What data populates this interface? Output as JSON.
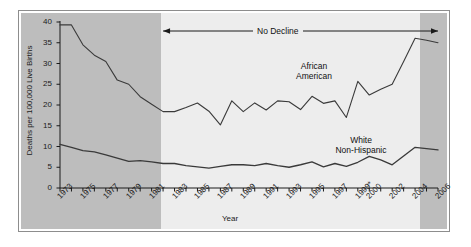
{
  "figure": {
    "background_color": "#ffffff",
    "panel_color": "#bdbdbd",
    "highlight_band_color": "#ededed",
    "line_color": "#3a3a3a"
  },
  "annotations": {
    "no_decline": {
      "text": "No Decline",
      "start_year": 1982,
      "end_year": 2006,
      "arrow": "double-headed"
    }
  },
  "series_labels": {
    "african_american": "African\nAmerican",
    "african_american_line1": "African",
    "african_american_line2": "American",
    "white_non_hispanic_line1": "White",
    "white_non_hispanic_line2": "Non-Hispanic"
  },
  "chart_data": {
    "type": "line",
    "title": "",
    "xlabel": "Year",
    "ylabel": "Deaths per 100,000 Live Births",
    "xlim": [
      1973,
      2006
    ],
    "ylim": [
      0,
      40
    ],
    "yticks": [
      0,
      5,
      10,
      15,
      20,
      25,
      30,
      35,
      40
    ],
    "ytick_labels": [
      "0",
      "5",
      "10",
      "15",
      "20",
      "25",
      "30",
      "35",
      "40"
    ],
    "xticks": [
      1973,
      1974,
      1975,
      1976,
      1977,
      1978,
      1979,
      1980,
      1981,
      1982,
      1983,
      1984,
      1985,
      1986,
      1987,
      1988,
      1989,
      1990,
      1991,
      1992,
      1993,
      1994,
      1995,
      1996,
      1997,
      1998,
      1999,
      2000,
      2001,
      2002,
      2003,
      2004,
      2005,
      2006
    ],
    "xtick_labels": [
      "1973",
      "1975",
      "1977",
      "1979",
      "1981",
      "1983",
      "1985",
      "1987",
      "1989",
      "1991",
      "1993",
      "1995",
      "1997",
      "1999*",
      "2000",
      "2002",
      "2004",
      "2006"
    ],
    "xtick_label_years": [
      1973,
      1975,
      1977,
      1979,
      1981,
      1983,
      1985,
      1987,
      1989,
      1991,
      1993,
      1995,
      1997,
      1999,
      2000,
      2002,
      2004,
      2006
    ],
    "grid": false,
    "legend_position": "inline-labels",
    "x": [
      1973,
      1974,
      1975,
      1976,
      1977,
      1978,
      1979,
      1980,
      1981,
      1982,
      1983,
      1984,
      1985,
      1986,
      1987,
      1988,
      1989,
      1990,
      1991,
      1992,
      1993,
      1994,
      1995,
      1996,
      1997,
      1998,
      1999,
      2000,
      2001,
      2002,
      2003,
      2004,
      2005,
      2006
    ],
    "series": [
      {
        "name": "African American",
        "values": [
          39.3,
          39.3,
          34.5,
          32.0,
          30.5,
          26.0,
          25.0,
          22.0,
          20.2,
          18.4,
          18.4,
          19.4,
          20.5,
          18.5,
          15.2,
          21.0,
          18.4,
          20.5,
          18.8,
          21.0,
          20.8,
          18.9,
          22.1,
          20.4,
          21.0,
          17.0,
          25.7,
          22.4,
          23.8,
          25.0,
          30.5,
          36.1,
          35.6,
          35.0
        ]
      },
      {
        "name": "White Non-Hispanic",
        "values": [
          10.5,
          9.8,
          9.0,
          8.7,
          8.0,
          7.2,
          6.4,
          6.6,
          6.3,
          5.9,
          5.9,
          5.4,
          5.1,
          4.8,
          5.2,
          5.6,
          5.6,
          5.4,
          5.9,
          5.4,
          5.0,
          5.6,
          6.3,
          5.1,
          5.9,
          5.2,
          6.2,
          7.6,
          6.8,
          5.6,
          7.7,
          9.8,
          9.5,
          9.2
        ]
      }
    ]
  }
}
